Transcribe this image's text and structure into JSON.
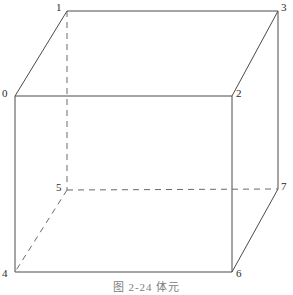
{
  "figure": {
    "caption": "图 2-24  体元",
    "caption_number": "2-24",
    "caption_title": "体元",
    "line_color": "#4a4a4a",
    "dashed_line_color": "#6a6a6a",
    "label_color": "#2b2b2b",
    "background_color": "#ffffff",
    "stroke_width": 1
  },
  "vertices": [
    {
      "id": "0",
      "label": "0",
      "x": 15,
      "y": 96,
      "label_x": 2,
      "label_y": 88,
      "hidden": false
    },
    {
      "id": "1",
      "label": "1",
      "x": 67,
      "y": 11,
      "label_x": 56,
      "label_y": 2,
      "hidden": false
    },
    {
      "id": "2",
      "label": "2",
      "x": 232,
      "y": 96,
      "label_x": 236,
      "label_y": 88,
      "hidden": false
    },
    {
      "id": "3",
      "label": "3",
      "x": 278,
      "y": 11,
      "label_x": 281,
      "label_y": 2,
      "hidden": false
    },
    {
      "id": "4",
      "label": "4",
      "x": 15,
      "y": 272,
      "label_x": 2,
      "label_y": 268,
      "hidden": false
    },
    {
      "id": "5",
      "label": "5",
      "x": 67,
      "y": 190,
      "label_x": 56,
      "label_y": 182,
      "hidden": true
    },
    {
      "id": "6",
      "label": "6",
      "x": 232,
      "y": 272,
      "label_x": 236,
      "label_y": 268,
      "hidden": false
    },
    {
      "id": "7",
      "label": "7",
      "x": 278,
      "y": 189,
      "label_x": 281,
      "label_y": 181,
      "hidden": false
    }
  ],
  "edges": [
    {
      "name": "edge-0-1",
      "from": "0",
      "to": "1",
      "style": "solid"
    },
    {
      "name": "edge-1-3",
      "from": "1",
      "to": "3",
      "style": "solid"
    },
    {
      "name": "edge-3-2",
      "from": "3",
      "to": "2",
      "style": "solid"
    },
    {
      "name": "edge-0-2",
      "from": "0",
      "to": "2",
      "style": "solid"
    },
    {
      "name": "edge-0-4",
      "from": "0",
      "to": "4",
      "style": "solid"
    },
    {
      "name": "edge-2-6",
      "from": "2",
      "to": "6",
      "style": "solid"
    },
    {
      "name": "edge-3-7",
      "from": "3",
      "to": "7",
      "style": "solid"
    },
    {
      "name": "edge-4-6",
      "from": "4",
      "to": "6",
      "style": "solid"
    },
    {
      "name": "edge-6-7",
      "from": "6",
      "to": "7",
      "style": "solid"
    },
    {
      "name": "edge-1-5",
      "from": "1",
      "to": "5",
      "style": "dashed"
    },
    {
      "name": "edge-5-7",
      "from": "5",
      "to": "7",
      "style": "dashed"
    },
    {
      "name": "edge-5-4",
      "from": "5",
      "to": "4",
      "style": "dashed"
    }
  ]
}
